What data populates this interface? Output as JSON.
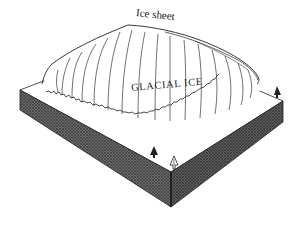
{
  "diagram": {
    "labels": {
      "ice_sheet": "Ice sheet",
      "glacial_ice": "GLACIAL ICE"
    },
    "colors": {
      "background": "#ffffff",
      "ink": "#222222",
      "ice_fill": "#ffffff",
      "ground_top": "#ffffff",
      "block_side_left": "#5f5f5f",
      "block_side_right": "#555555",
      "crosshatch": "#3c3c3c"
    },
    "elements": [
      {
        "type": "ice-dome",
        "description": "Dome-shaped glacial ice mass with radial flow lines"
      },
      {
        "type": "ice-margin",
        "description": "Ragged terminal margin of ice on ground surface"
      },
      {
        "type": "ground-block",
        "description": "Isometric block with crosshatched sides"
      },
      {
        "type": "tree",
        "count": 3
      }
    ]
  }
}
